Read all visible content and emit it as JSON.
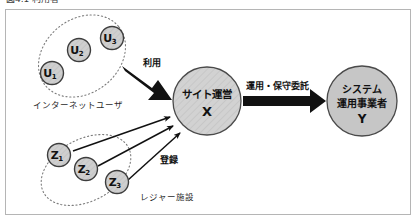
{
  "caption": {
    "text": "図4.1  利用者"
  },
  "figure": {
    "frame_color": "#b5b5b5",
    "background": "#ffffff"
  },
  "colors": {
    "node_fill": "#c9c9c9",
    "node_fill_light": "#d8d8d8",
    "node_stroke": "#4a4a4a",
    "arrow": "#111111",
    "dotted_group": "#808080",
    "text": "#111111"
  },
  "groups": [
    {
      "id": "internet-users",
      "label": "インターネットユーザ",
      "members": [
        "U1",
        "U2",
        "U3"
      ]
    },
    {
      "id": "leisure-facilities",
      "label": "レジャー施設",
      "members": [
        "Z1",
        "Z2",
        "Z3"
      ]
    }
  ],
  "nodes": {
    "u1": {
      "base": "U",
      "sub": "1"
    },
    "u2": {
      "base": "U",
      "sub": "2"
    },
    "u3": {
      "base": "U",
      "sub": "3"
    },
    "z1": {
      "base": "Z",
      "sub": "1"
    },
    "z2": {
      "base": "Z",
      "sub": "2"
    },
    "z3": {
      "base": "Z",
      "sub": "3"
    },
    "site": {
      "line1": "サイト運営",
      "line2": "X"
    },
    "system": {
      "line1": "システム",
      "line2": "運用事業者",
      "line3": "Y"
    }
  },
  "edges": [
    {
      "id": "use",
      "label": "利用",
      "from": "internet-users",
      "to": "site",
      "style": "thick-block"
    },
    {
      "id": "register",
      "label": "登録",
      "from": "leisure-facilities",
      "to": "site",
      "style": "thin-line"
    },
    {
      "id": "ops-maintenance",
      "label": "運用・保守委託",
      "from": "site",
      "to": "system",
      "style": "thick-block"
    }
  ]
}
